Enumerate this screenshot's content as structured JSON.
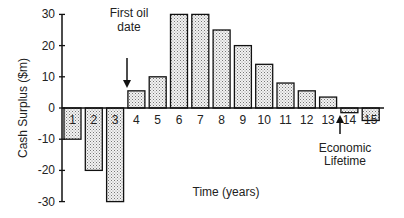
{
  "chart_data": {
    "type": "bar",
    "title": "",
    "xlabel": "Time (years)",
    "ylabel": "Cash Surplus ($m)",
    "ylim": [
      -30,
      30
    ],
    "yticks": [
      30,
      20,
      10,
      0,
      -10,
      -20,
      -30
    ],
    "grid": false,
    "legend": null,
    "categories": [
      "1",
      "2",
      "3",
      "4",
      "5",
      "6",
      "7",
      "8",
      "9",
      "10",
      "11",
      "12",
      "13",
      "14",
      "15"
    ],
    "values": [
      -10,
      -20,
      -30,
      5.5,
      10,
      30,
      30,
      25,
      20,
      14,
      8,
      5.5,
      3.5,
      -1.5,
      -4
    ],
    "annotations": [
      {
        "text_lines": [
          "First oil",
          "date"
        ],
        "points_to": "4",
        "arrow": "down"
      },
      {
        "text_lines": [
          "Economic",
          "Lifetime"
        ],
        "points_to": "13-14 boundary",
        "arrow": "up"
      }
    ],
    "bar_fill": "stippled light gray",
    "bar_stroke": "#111111"
  }
}
